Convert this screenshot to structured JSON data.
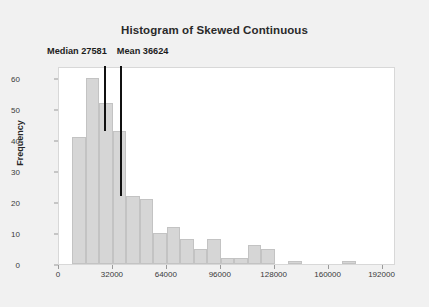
{
  "chart_data": {
    "type": "bar",
    "title": "Histogram of Skewed Continuous",
    "xlabel": "",
    "ylabel": "Frequency",
    "bin_width": 8000,
    "bin_starts": [
      8000,
      16000,
      24000,
      32000,
      40000,
      48000,
      56000,
      64000,
      72000,
      80000,
      88000,
      96000,
      104000,
      112000,
      120000,
      128000,
      136000,
      144000,
      152000,
      160000,
      168000
    ],
    "categories": [
      "8000-16000",
      "16000-24000",
      "24000-32000",
      "32000-40000",
      "40000-48000",
      "48000-56000",
      "56000-64000",
      "64000-72000",
      "72000-80000",
      "80000-88000",
      "88000-96000",
      "96000-104000",
      "104000-112000",
      "112000-120000",
      "120000-128000",
      "128000-136000",
      "136000-144000",
      "144000-152000",
      "152000-160000",
      "160000-168000",
      "168000-176000"
    ],
    "values": [
      41,
      60,
      52,
      43,
      22,
      21,
      10,
      12,
      8,
      5,
      8,
      2,
      2,
      6,
      5,
      0,
      1,
      0,
      0,
      0,
      1
    ],
    "xlim": [
      0,
      200000
    ],
    "ylim": [
      0,
      64
    ],
    "xticks": [
      0,
      32000,
      64000,
      96000,
      128000,
      160000,
      192000
    ],
    "xtick_labels": [
      "0",
      "32000",
      "64000",
      "96000",
      "128000",
      "160000",
      "192000"
    ],
    "yticks": [
      0,
      10,
      20,
      30,
      40,
      50,
      60
    ],
    "ytick_labels": [
      "0",
      "10",
      "20",
      "30",
      "40",
      "50",
      "60"
    ],
    "grid": false,
    "legend": "none",
    "bar_color": "#d6d6d6",
    "bar_edge_color": "#c3c3c3",
    "plot_background": "#ffffff",
    "figure_background": "#f1f1f1",
    "marker_color": "#111111",
    "annotations": [
      {
        "name": "median",
        "label": "Median 27581",
        "value": 27581,
        "line_top_frequency": 64,
        "line_bottom_frequency": 43
      },
      {
        "name": "mean",
        "label": "Mean 36624",
        "value": 36624,
        "line_top_frequency": 64,
        "line_bottom_frequency": 22
      }
    ]
  }
}
